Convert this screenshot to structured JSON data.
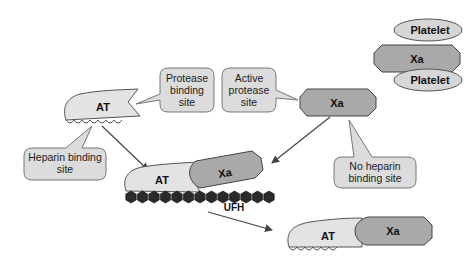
{
  "colors": {
    "at_fill": "#e3e3e3",
    "xa_fill": "#a9a9a9",
    "platelet_fill": "#d6d6d6",
    "callout_fill": "#dcdcdc",
    "outline": "#555555",
    "heparin_bead": "#2a2a2a",
    "arrow": "#444444"
  },
  "molecules": {
    "at_free": "AT",
    "xa_free": "Xa",
    "at_ternary": "AT",
    "xa_ternary": "Xa",
    "ufh": "UFH",
    "at_product": "AT",
    "xa_product": "Xa",
    "platelet_top": "Platelet",
    "xa_platelet": "Xa",
    "platelet_bottom": "Platelet"
  },
  "callouts": {
    "protease_binding_site": [
      "Protease",
      "binding",
      "site"
    ],
    "active_protease_site": [
      "Active",
      "protease",
      "site"
    ],
    "heparin_binding_site": [
      "Heparin binding",
      "site"
    ],
    "no_heparin_binding_site": [
      "No heparin",
      "binding site"
    ]
  }
}
